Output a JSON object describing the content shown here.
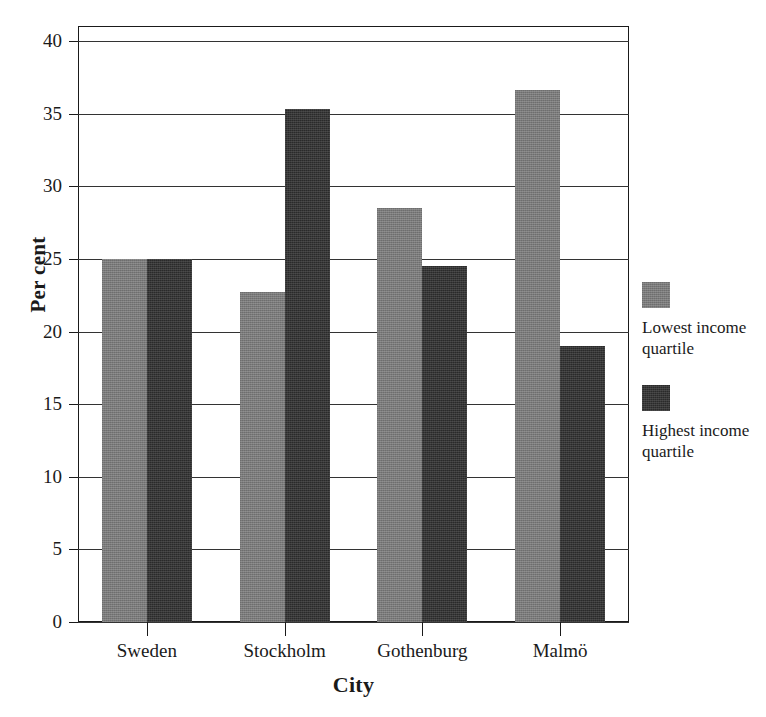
{
  "chart_data": {
    "type": "bar",
    "title": "",
    "subtitle": "",
    "xlabel": "City",
    "ylabel": "Per cent",
    "categories": [
      "Sweden",
      "Stockholm",
      "Gothenburg",
      "Malmö"
    ],
    "series": [
      {
        "name": "Lowest income quartile",
        "color": "#7a7a7a",
        "values": [
          25.0,
          22.7,
          28.5,
          36.6
        ]
      },
      {
        "name": "Highest income quartile",
        "color": "#2a2a2a",
        "values": [
          25.0,
          35.3,
          24.5,
          19.0
        ]
      }
    ],
    "ylim": [
      0,
      40
    ],
    "yticks": [
      0,
      5,
      10,
      15,
      20,
      25,
      30,
      35,
      40
    ],
    "ytick_labels": [
      "0",
      "5",
      "10",
      "15",
      "20",
      "25",
      "30",
      "35",
      "40"
    ],
    "grid": true,
    "grid_axis": "y",
    "legend_position": "right",
    "frame": true
  },
  "legend": {
    "entries": [
      {
        "label_line1": "Lowest income",
        "label_line2": "quartile",
        "swatch": "legend-swatch-lowest"
      },
      {
        "label_line1": "Highest income",
        "label_line2": "quartile",
        "swatch": "legend-swatch-highest"
      }
    ]
  },
  "axes": {
    "y_title": "Per cent",
    "x_title": "City"
  }
}
